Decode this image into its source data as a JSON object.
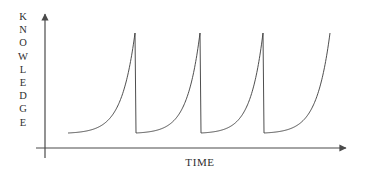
{
  "figure": {
    "background_color": "#ffffff",
    "line_color": "#3a3a3a",
    "text_color": "#2e2e2e",
    "axis_color": "#4a4a4a"
  },
  "axes": {
    "y_label_text": "KNOWLEDGE",
    "y_label_letters": [
      "K",
      "N",
      "O",
      "W",
      "L",
      "E",
      "D",
      "G",
      "E"
    ],
    "x_label_text": "TIME"
  },
  "chart_data": {
    "type": "line",
    "title": "",
    "xlabel": "TIME",
    "ylabel": "KNOWLEDGE",
    "xlim": [
      0,
      1
    ],
    "ylim": [
      0,
      1
    ],
    "grid": false,
    "legend": null,
    "cycles": 4,
    "series": [
      {
        "name": "knowledge",
        "segments": [
          {
            "index": 1,
            "start": {
              "x": 68,
              "y": 133
            },
            "peak": {
              "x": 135,
              "y": 33
            },
            "drop_to": {
              "x": 136,
              "y": 133
            },
            "has_drop": true
          },
          {
            "index": 2,
            "start": {
              "x": 136,
              "y": 133
            },
            "peak": {
              "x": 200,
              "y": 33
            },
            "drop_to": {
              "x": 201,
              "y": 133
            },
            "has_drop": true
          },
          {
            "index": 3,
            "start": {
              "x": 201,
              "y": 133
            },
            "peak": {
              "x": 263,
              "y": 33
            },
            "drop_to": {
              "x": 264,
              "y": 133
            },
            "has_drop": true
          },
          {
            "index": 4,
            "start": {
              "x": 264,
              "y": 133
            },
            "peak": {
              "x": 330,
              "y": 33
            },
            "drop_to": null,
            "has_drop": false
          }
        ],
        "baseline_y": 133,
        "peak_y": 33
      }
    ],
    "axis_geometry": {
      "y_axis_x": 45,
      "y_axis_top": 12,
      "y_axis_bottom": 158,
      "x_axis_y": 148,
      "x_axis_left": 36,
      "x_axis_right": 350
    }
  }
}
